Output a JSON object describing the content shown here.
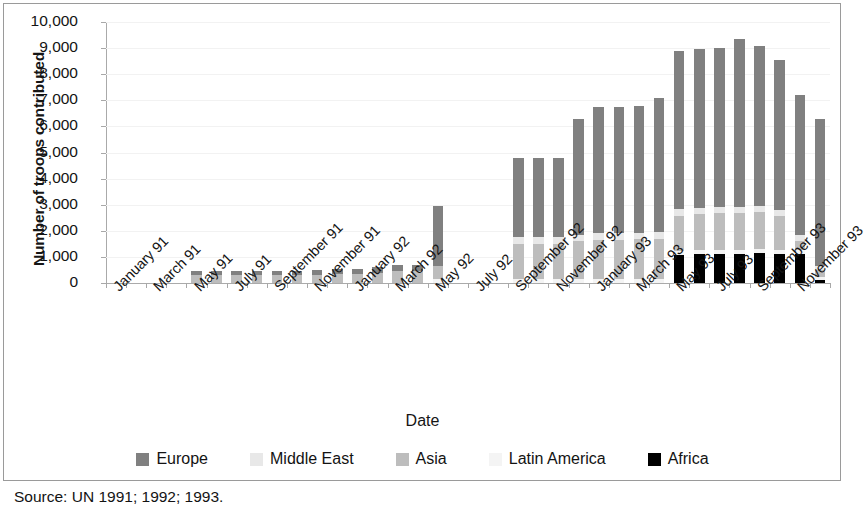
{
  "figure": {
    "source_note": "Source: UN 1991; 1992; 1993.",
    "border_color": "#9a9a9a",
    "background": "#ffffff"
  },
  "chart_data": {
    "type": "bar",
    "stacked": true,
    "title": "",
    "xlabel": "Date",
    "ylabel": "Number of troops contributed",
    "ylim": [
      0,
      10000
    ],
    "yticks": [
      0,
      1000,
      2000,
      3000,
      4000,
      5000,
      6000,
      7000,
      8000,
      9000,
      10000
    ],
    "ytick_labels": [
      "0",
      "1,000",
      "2,000",
      "3,000",
      "4,000",
      "5,000",
      "6,000",
      "7,000",
      "8,000",
      "9,000",
      "10,000"
    ],
    "grid": true,
    "legend_position": "bottom",
    "colors": {
      "Europe": "#808080",
      "Middle East": "#e8e8e8",
      "Asia": "#bdbdbd",
      "Latin America": "#f4f4f4",
      "Africa": "#000000"
    },
    "categories": [
      "January 91",
      "February 91",
      "March 91",
      "April 91",
      "May 91",
      "June 91",
      "July 91",
      "August 91",
      "September 91",
      "October 91",
      "November 91",
      "December 91",
      "January 92",
      "February 92",
      "March 92",
      "April 92",
      "May 92",
      "June 92",
      "July 92",
      "August 92",
      "September 92",
      "October 92",
      "November 92",
      "December 92",
      "January 93",
      "February 93",
      "March 93",
      "April 93",
      "May 93",
      "June 93",
      "July 93",
      "August 93",
      "September 93",
      "October 93",
      "November 93",
      "December 93"
    ],
    "tick_labels": [
      "January 91",
      "March 91",
      "May 91",
      "July 91",
      "September 91",
      "November 91",
      "January 92",
      "March 92",
      "May 92",
      "July 92",
      "September 92",
      "November 92",
      "January 93",
      "March 93",
      "May 93",
      "July 93",
      "September 93",
      "November 93"
    ],
    "series": [
      {
        "name": "Africa",
        "values": [
          0,
          0,
          0,
          0,
          0,
          0,
          0,
          0,
          0,
          0,
          0,
          0,
          0,
          0,
          0,
          0,
          0,
          0,
          0,
          0,
          0,
          0,
          0,
          0,
          0,
          0,
          0,
          0,
          1100,
          1150,
          1150,
          1150,
          1200,
          1150,
          1150,
          100
        ]
      },
      {
        "name": "Latin America",
        "values": [
          0,
          0,
          0,
          0,
          0,
          0,
          0,
          0,
          0,
          0,
          0,
          0,
          0,
          0,
          0,
          0,
          150,
          0,
          0,
          0,
          150,
          150,
          150,
          150,
          150,
          150,
          150,
          150,
          150,
          150,
          150,
          150,
          150,
          150,
          150,
          150
        ]
      },
      {
        "name": "Asia",
        "values": [
          0,
          0,
          0,
          0,
          300,
          300,
          300,
          300,
          300,
          300,
          300,
          350,
          350,
          400,
          450,
          450,
          500,
          0,
          0,
          0,
          1350,
          1350,
          1350,
          1450,
          1500,
          1500,
          1550,
          1600,
          1350,
          1400,
          1450,
          1450,
          1450,
          1350,
          350,
          250
        ]
      },
      {
        "name": "Middle East",
        "values": [
          0,
          0,
          0,
          0,
          0,
          0,
          0,
          0,
          0,
          0,
          0,
          0,
          0,
          0,
          0,
          0,
          0,
          0,
          0,
          0,
          250,
          250,
          250,
          250,
          250,
          250,
          250,
          250,
          250,
          250,
          250,
          250,
          250,
          250,
          250,
          150
        ]
      },
      {
        "name": "Europe",
        "values": [
          0,
          0,
          0,
          0,
          180,
          180,
          180,
          180,
          180,
          180,
          200,
          200,
          200,
          200,
          250,
          250,
          2300,
          0,
          0,
          0,
          3050,
          3050,
          3050,
          4450,
          4850,
          4850,
          4900,
          5300,
          6150,
          6200,
          6250,
          6600,
          6350,
          5950,
          5550,
          5750
        ]
      }
    ],
    "bar_totals": [
      0,
      0,
      0,
      0,
      480,
      480,
      480,
      480,
      480,
      480,
      500,
      550,
      550,
      600,
      700,
      700,
      2950,
      0,
      0,
      0,
      4800,
      4800,
      4800,
      6300,
      6750,
      6750,
      6800,
      7100,
      8900,
      8950,
      9000,
      9350,
      9100,
      8550,
      7200,
      6300
    ]
  },
  "legend": {
    "items": [
      {
        "label": "Europe",
        "color": "#808080"
      },
      {
        "label": "Middle East",
        "color": "#e8e8e8"
      },
      {
        "label": "Asia",
        "color": "#bdbdbd"
      },
      {
        "label": "Latin America",
        "color": "#f4f4f4"
      },
      {
        "label": "Africa",
        "color": "#000000"
      }
    ]
  }
}
